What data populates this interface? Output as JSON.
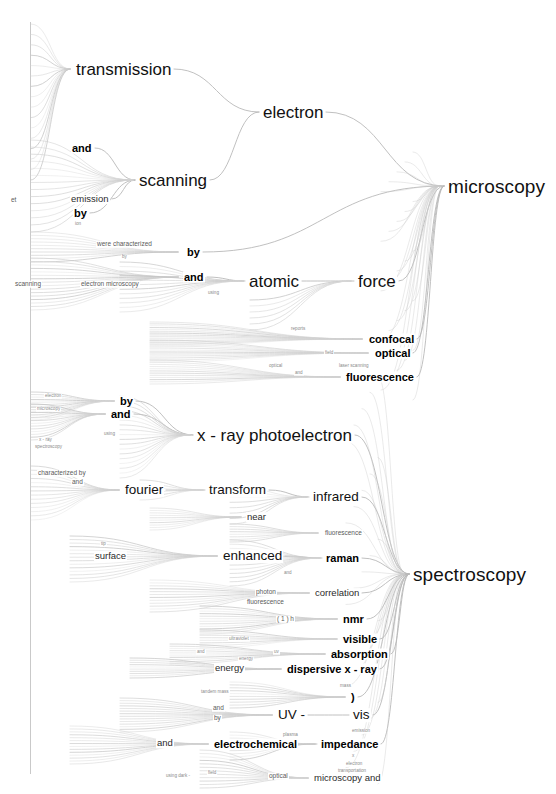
{
  "figure": {
    "type": "word-tree",
    "background": "#ffffff",
    "link_color": "#b9b9b9",
    "text_color": "#111111",
    "root_spine_color": "#c9c9c9",
    "caption": ""
  },
  "chart_data": {
    "type": "table",
    "title": "",
    "xlabel": "",
    "ylabel": "",
    "roots": [
      "microscopy",
      "spectroscopy"
    ]
  },
  "nodes": [
    {
      "id": "n0",
      "label": "transmission",
      "x": 75,
      "y": 69,
      "level": "lvl-1"
    },
    {
      "id": "n1",
      "label": "electron",
      "x": 262,
      "y": 112,
      "level": "lvl-1"
    },
    {
      "id": "n2",
      "label": "microscopy",
      "x": 447,
      "y": 186,
      "level": "lvl-root"
    },
    {
      "id": "n3",
      "label": "scanning",
      "x": 138,
      "y": 180,
      "level": "lvl-1"
    },
    {
      "id": "n4",
      "label": "and",
      "x": 71,
      "y": 148,
      "level": "lvl-3"
    },
    {
      "id": "n5",
      "label": "emission",
      "x": 70,
      "y": 199,
      "level": "lvl-4"
    },
    {
      "id": "n6",
      "label": "by",
      "x": 73,
      "y": 213,
      "level": "lvl-3"
    },
    {
      "id": "n7",
      "label": "ion",
      "x": 74,
      "y": 224,
      "level": "lvl-6"
    },
    {
      "id": "n8",
      "label": "et",
      "x": 10,
      "y": 200,
      "level": "lvl-5"
    },
    {
      "id": "n9",
      "label": "by",
      "x": 186,
      "y": 252,
      "level": "lvl-3"
    },
    {
      "id": "n10",
      "label": "and",
      "x": 183,
      "y": 277,
      "level": "lvl-3"
    },
    {
      "id": "n11",
      "label": "atomic",
      "x": 248,
      "y": 281,
      "level": "lvl-1"
    },
    {
      "id": "n12",
      "label": "force",
      "x": 357,
      "y": 281,
      "level": "lvl-1"
    },
    {
      "id": "n13",
      "label": "were  characterized",
      "x": 96,
      "y": 244,
      "level": "lvl-5"
    },
    {
      "id": "n14",
      "label": "scanning",
      "x": 14,
      "y": 284,
      "level": "lvl-5"
    },
    {
      "id": "n15",
      "label": "electron   microscopy",
      "x": 80,
      "y": 284,
      "level": "lvl-5"
    },
    {
      "id": "n16",
      "label": "by",
      "x": 121,
      "y": 257,
      "level": "lvl-6"
    },
    {
      "id": "n17",
      "label": "using",
      "x": 207,
      "y": 293,
      "level": "lvl-6"
    },
    {
      "id": "n18",
      "label": "reports",
      "x": 290,
      "y": 329,
      "level": "lvl-6"
    },
    {
      "id": "n19",
      "label": "confocal",
      "x": 368,
      "y": 339,
      "level": "lvl-3"
    },
    {
      "id": "n20",
      "label": "optical",
      "x": 374,
      "y": 353,
      "level": "lvl-3"
    },
    {
      "id": "n21",
      "label": "field",
      "x": 324,
      "y": 353,
      "level": "lvl-6"
    },
    {
      "id": "n22",
      "label": "laser   scanning",
      "x": 338,
      "y": 366,
      "level": "lvl-6"
    },
    {
      "id": "n23",
      "label": "optical",
      "x": 268,
      "y": 366,
      "level": "lvl-6"
    },
    {
      "id": "n24",
      "label": "fluorescence",
      "x": 345,
      "y": 377,
      "level": "lvl-3"
    },
    {
      "id": "n25",
      "label": "and",
      "x": 294,
      "y": 373,
      "level": "lvl-6"
    },
    {
      "id": "n26",
      "label": "x - ray photoelectron",
      "x": 196,
      "y": 435,
      "level": "lvl-1"
    },
    {
      "id": "n27",
      "label": "spectroscopy",
      "x": 412,
      "y": 574,
      "level": "lvl-root"
    },
    {
      "id": "n28",
      "label": "by",
      "x": 119,
      "y": 401,
      "level": "lvl-3"
    },
    {
      "id": "n29",
      "label": "and",
      "x": 110,
      "y": 414,
      "level": "lvl-3"
    },
    {
      "id": "n30",
      "label": "electron",
      "x": 44,
      "y": 396,
      "level": "lvl-6"
    },
    {
      "id": "n31",
      "label": "microscopy",
      "x": 36,
      "y": 409,
      "level": "lvl-6"
    },
    {
      "id": "n32",
      "label": "using",
      "x": 103,
      "y": 434,
      "level": "lvl-6"
    },
    {
      "id": "n33",
      "label": "x - ray",
      "x": 38,
      "y": 440,
      "level": "lvl-6"
    },
    {
      "id": "n34",
      "label": "spectroscopy",
      "x": 34,
      "y": 447,
      "level": "lvl-6"
    },
    {
      "id": "n35",
      "label": "characterized    by",
      "x": 37,
      "y": 473,
      "level": "lvl-5"
    },
    {
      "id": "n36",
      "label": "and",
      "x": 71,
      "y": 482,
      "level": "lvl-5"
    },
    {
      "id": "n37",
      "label": "fourier",
      "x": 124,
      "y": 490,
      "level": "lvl-2"
    },
    {
      "id": "n38",
      "label": "transform",
      "x": 208,
      "y": 490,
      "level": "lvl-2"
    },
    {
      "id": "n39",
      "label": "infrared",
      "x": 312,
      "y": 497,
      "level": "lvl-2"
    },
    {
      "id": "n40",
      "label": "near",
      "x": 246,
      "y": 517,
      "level": "lvl-4"
    },
    {
      "id": "n41",
      "label": "fluorescence",
      "x": 324,
      "y": 533,
      "level": "lvl-5"
    },
    {
      "id": "n42",
      "label": "surface",
      "x": 94,
      "y": 556,
      "level": "lvl-4"
    },
    {
      "id": "n43",
      "label": "enhanced",
      "x": 222,
      "y": 556,
      "level": "lvl-2"
    },
    {
      "id": "n44",
      "label": "raman",
      "x": 325,
      "y": 558,
      "level": "lvl-3"
    },
    {
      "id": "n45",
      "label": "tip",
      "x": 100,
      "y": 544,
      "level": "lvl-6"
    },
    {
      "id": "n46",
      "label": "and",
      "x": 283,
      "y": 573,
      "level": "lvl-6"
    },
    {
      "id": "n47",
      "label": "photon",
      "x": 255,
      "y": 592,
      "level": "lvl-5"
    },
    {
      "id": "n48",
      "label": "correlation",
      "x": 314,
      "y": 593,
      "level": "lvl-4"
    },
    {
      "id": "n49",
      "label": "fluorescence",
      "x": 246,
      "y": 602,
      "level": "lvl-5"
    },
    {
      "id": "n50",
      "label": "nmr",
      "x": 342,
      "y": 619,
      "level": "lvl-3"
    },
    {
      "id": "n51",
      "label": "( 1 ) h",
      "x": 276,
      "y": 619,
      "level": "lvl-5"
    },
    {
      "id": "n52",
      "label": "visible",
      "x": 342,
      "y": 639,
      "level": "lvl-3"
    },
    {
      "id": "n53",
      "label": "ultraviolet",
      "x": 228,
      "y": 639,
      "level": "lvl-6"
    },
    {
      "id": "n54",
      "label": "absorption",
      "x": 330,
      "y": 654,
      "level": "lvl-3"
    },
    {
      "id": "n55",
      "label": "uv",
      "x": 273,
      "y": 652,
      "level": "lvl-6"
    },
    {
      "id": "n56",
      "label": "and",
      "x": 196,
      "y": 652,
      "level": "lvl-6"
    },
    {
      "id": "n57",
      "label": "dispersive x - ray",
      "x": 286,
      "y": 669,
      "level": "lvl-3"
    },
    {
      "id": "n58",
      "label": "energy",
      "x": 214,
      "y": 668,
      "level": "lvl-4"
    },
    {
      "id": "n59",
      "label": "energy",
      "x": 238,
      "y": 659,
      "level": "lvl-6"
    },
    {
      "id": "n60",
      "label": "mass",
      "x": 339,
      "y": 686,
      "level": "lvl-6"
    },
    {
      "id": "n61",
      "label": "tandem    mass",
      "x": 200,
      "y": 692,
      "level": "lvl-6"
    },
    {
      "id": "n62",
      "label": ")",
      "x": 350,
      "y": 697,
      "level": "lvl-3"
    },
    {
      "id": "n63",
      "label": "UV -",
      "x": 277,
      "y": 715,
      "level": "lvl-2"
    },
    {
      "id": "n64",
      "label": "vis",
      "x": 352,
      "y": 715,
      "level": "lvl-2"
    },
    {
      "id": "n65",
      "label": "and",
      "x": 212,
      "y": 708,
      "level": "lvl-5"
    },
    {
      "id": "n66",
      "label": "by",
      "x": 213,
      "y": 718,
      "level": "lvl-5"
    },
    {
      "id": "n67",
      "label": "emission",
      "x": 351,
      "y": 731,
      "level": "lvl-6"
    },
    {
      "id": "n68",
      "label": "and",
      "x": 156,
      "y": 743,
      "level": "lvl-4"
    },
    {
      "id": "n69",
      "label": "electrochemical",
      "x": 213,
      "y": 744,
      "level": "lvl-3"
    },
    {
      "id": "n70",
      "label": "impedance",
      "x": 320,
      "y": 744,
      "level": "lvl-3"
    },
    {
      "id": "n71",
      "label": "plasma",
      "x": 282,
      "y": 735,
      "level": "lvl-6"
    },
    {
      "id": "n72",
      "label": "x",
      "x": 351,
      "y": 756,
      "level": "lvl-6"
    },
    {
      "id": "n73",
      "label": "electron",
      "x": 345,
      "y": 764,
      "level": "lvl-6"
    },
    {
      "id": "n74",
      "label": "transportation",
      "x": 337,
      "y": 771,
      "level": "lvl-6"
    },
    {
      "id": "n75",
      "label": "optical",
      "x": 268,
      "y": 776,
      "level": "lvl-5"
    },
    {
      "id": "n76",
      "label": "microscopy   and",
      "x": 313,
      "y": 778,
      "level": "lvl-4"
    },
    {
      "id": "n77",
      "label": "using  dark -",
      "x": 165,
      "y": 776,
      "level": "lvl-6"
    },
    {
      "id": "n78",
      "label": "field",
      "x": 207,
      "y": 773,
      "level": "lvl-6"
    }
  ],
  "links": [
    {
      "from": "n0",
      "to": "n1",
      "c": 1
    },
    {
      "from": "n3",
      "to": "n1",
      "c": 1
    },
    {
      "from": "n1",
      "to": "n2",
      "c": 1
    },
    {
      "from": "n9",
      "to": "n2",
      "c": 1
    },
    {
      "from": "n11",
      "to": "n12",
      "c": 1
    },
    {
      "from": "n12",
      "to": "n2",
      "c": 1
    },
    {
      "from": "n10",
      "to": "n11",
      "c": 1
    },
    {
      "from": "n19",
      "to": "n2",
      "c": 1
    },
    {
      "from": "n20",
      "to": "n2",
      "c": 1
    },
    {
      "from": "n24",
      "to": "n2",
      "c": 1
    },
    {
      "from": "n26",
      "to": "n27",
      "c": 1
    },
    {
      "from": "n39",
      "to": "n27",
      "c": 1
    },
    {
      "from": "n44",
      "to": "n27",
      "c": 1
    },
    {
      "from": "n48",
      "to": "n27",
      "c": 1
    },
    {
      "from": "n50",
      "to": "n27",
      "c": 1
    },
    {
      "from": "n52",
      "to": "n27",
      "c": 1
    },
    {
      "from": "n54",
      "to": "n27",
      "c": 1
    },
    {
      "from": "n57",
      "to": "n27",
      "c": 1
    },
    {
      "from": "n62",
      "to": "n27",
      "c": 1
    },
    {
      "from": "n64",
      "to": "n27",
      "c": 1
    },
    {
      "from": "n70",
      "to": "n27",
      "c": 1
    },
    {
      "from": "n37",
      "to": "n38",
      "c": 1
    },
    {
      "from": "n38",
      "to": "n39",
      "c": 1
    },
    {
      "from": "n43",
      "to": "n44",
      "c": 1
    },
    {
      "from": "n63",
      "to": "n64",
      "c": 1
    },
    {
      "from": "n69",
      "to": "n70",
      "c": 1
    },
    {
      "from": "n28",
      "to": "n26",
      "c": 1
    },
    {
      "from": "n29",
      "to": "n26",
      "c": 1
    },
    {
      "from": "n4",
      "to": "n3",
      "c": 1
    },
    {
      "from": "n6",
      "to": "n3",
      "c": 1
    },
    {
      "from": "n5",
      "to": "n3",
      "c": 1
    }
  ]
}
